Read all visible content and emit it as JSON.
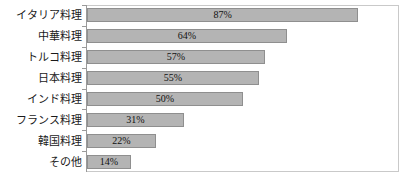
{
  "chart_data": {
    "type": "bar",
    "orientation": "horizontal",
    "title": "",
    "xlabel": "",
    "ylabel": "",
    "xlim": [
      0,
      100
    ],
    "grid": false,
    "legend": null,
    "value_suffix": "%",
    "categories": [
      "イタリア料理",
      "中華料理",
      "トルコ料理",
      "日本料理",
      "インド料理",
      "フランス料理",
      "韓国料理",
      "その他"
    ],
    "values": [
      87,
      64,
      57,
      55,
      50,
      31,
      22,
      14
    ],
    "value_labels": [
      "87%",
      "64%",
      "57%",
      "55%",
      "50%",
      "31%",
      "22%",
      "14%"
    ],
    "colors": {
      "bar_fill": "#b4b4b4",
      "bar_border": "#8f8f8f",
      "plot_border": "#c9c9c9",
      "axis_line": "#9a9a9a",
      "background": "#ffffff",
      "label_text": "#1a1a1a",
      "value_text": "#111111"
    }
  }
}
